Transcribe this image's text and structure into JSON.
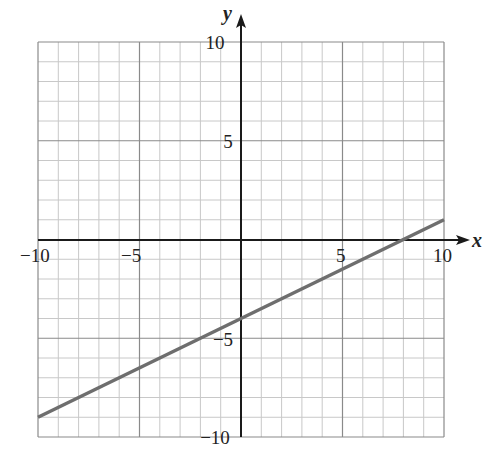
{
  "chart_data": {
    "type": "line",
    "title": "",
    "xlabel": "x",
    "ylabel": "y",
    "xlim": [
      -10,
      10
    ],
    "ylim": [
      -10,
      10
    ],
    "grid": true,
    "minor_grid_step": 1,
    "major_grid_step": 5,
    "x_ticks": [
      -10,
      -5,
      5,
      10
    ],
    "y_ticks": [
      10,
      5,
      -5,
      -10
    ],
    "x_tick_labels": [
      "−10",
      "−5",
      "5",
      "10"
    ],
    "y_tick_labels": [
      "10",
      "5",
      "−5",
      "−10"
    ],
    "series": [
      {
        "name": "line",
        "equation": "y = 0.5x - 4",
        "slope": 0.5,
        "intercept": -4,
        "x": [
          -10,
          10
        ],
        "y": [
          -9,
          1
        ],
        "color": "#6e6e6e"
      }
    ],
    "legend": null
  },
  "labels": {
    "x_axis": "x",
    "y_axis": "y",
    "x_ticks": [
      "−10",
      "−5",
      "5",
      "10"
    ],
    "y_ticks": [
      "10",
      "5",
      "−5",
      "−10"
    ]
  },
  "colors": {
    "minor_grid": "#c8c8c8",
    "major_grid": "#8a8a8a",
    "axis": "#1a1a1a",
    "line": "#6e6e6e"
  }
}
